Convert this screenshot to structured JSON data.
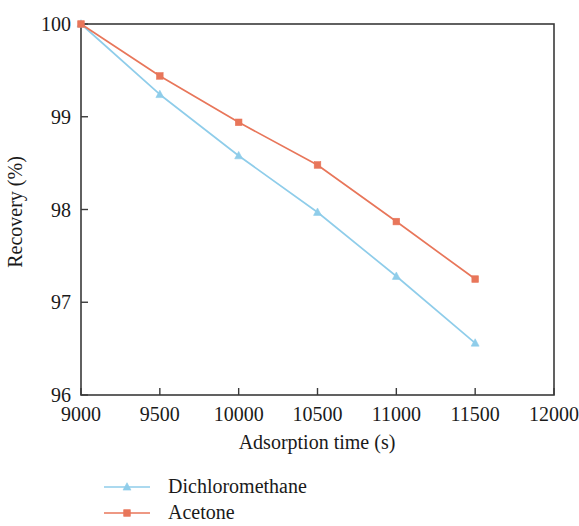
{
  "chart_data": {
    "type": "line",
    "title": "",
    "xlabel": "Adsorption time (s)",
    "ylabel": "Recovery (%)",
    "xlim": [
      9000,
      12000
    ],
    "ylim": [
      96,
      100
    ],
    "xticks": [
      9000,
      9500,
      10000,
      10500,
      11000,
      11500,
      12000
    ],
    "yticks": [
      96,
      97,
      98,
      99,
      100
    ],
    "xtick_labels": [
      "9000",
      "9500",
      "10000",
      "10500",
      "11000",
      "11500",
      "12000"
    ],
    "ytick_labels": [
      "96",
      "97",
      "98",
      "99",
      "100"
    ],
    "x": [
      9000,
      9500,
      10000,
      10500,
      11000,
      11500
    ],
    "grid": false,
    "legend_position": "below-left",
    "series": [
      {
        "name": "Dichloromethane",
        "color": "#8fcdea",
        "marker": "triangle",
        "values": [
          100,
          99.24,
          98.58,
          97.97,
          97.28,
          96.56
        ]
      },
      {
        "name": "Acetone",
        "color": "#e8765a",
        "marker": "square",
        "values": [
          100,
          99.44,
          98.94,
          98.48,
          97.87,
          97.25
        ]
      }
    ]
  },
  "axis": {
    "x_title": "Adsorption time (s)",
    "y_title": "Recovery (%)"
  },
  "legend": {
    "items": [
      {
        "label": "Dichloromethane",
        "color": "#8fcdea"
      },
      {
        "label": "Acetone",
        "color": "#e8765a"
      }
    ]
  },
  "colors": {
    "axis": "#3a3a3a",
    "text": "#1a1a1a",
    "background": "#ffffff",
    "series_1": "#8fcdea",
    "series_2": "#e8765a"
  }
}
